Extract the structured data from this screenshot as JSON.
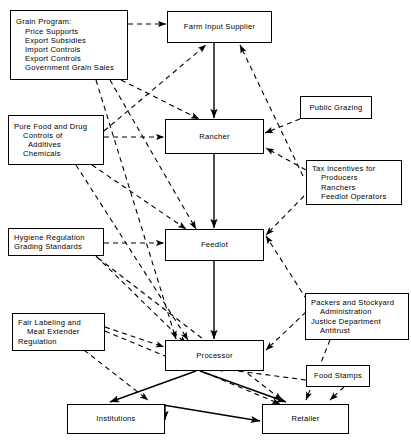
{
  "diagram": {
    "type": "flow-diagram",
    "line_styles": {
      "solid": "commodity flow between market participants",
      "dashed": "government policy / regulatory influence"
    },
    "colors": {
      "background": "#ffffff",
      "stroke": "#000000",
      "text": "#000000"
    }
  },
  "nodes": {
    "grain_program": {
      "id": "grain-program",
      "kind": "policy",
      "lines": [
        "Grain Program:",
        "Price Supports",
        "Export Subsidies",
        "Import Controls",
        "Export Controls",
        "Government Grain Sales"
      ]
    },
    "pure_food_drug": {
      "id": "pure-food-and-drug",
      "kind": "policy",
      "lines": [
        "Pure Food and Drug",
        "Controls of",
        "Additives",
        "Chemicals"
      ]
    },
    "hygiene_regulation": {
      "id": "hygiene-regulation",
      "kind": "policy",
      "lines": [
        "Hygiene Regulation",
        "Grading Standards"
      ]
    },
    "fair_labeling": {
      "id": "fair-labeling",
      "kind": "policy",
      "lines": [
        "Fair Labeling and",
        "Meat Extender",
        "Regulation"
      ]
    },
    "farm_input_supplier": {
      "id": "farm-input-supplier",
      "kind": "actor",
      "lines": [
        "Farm Input Supplier"
      ]
    },
    "rancher": {
      "id": "rancher",
      "kind": "actor",
      "lines": [
        "Rancher"
      ]
    },
    "feedlot": {
      "id": "feedlot",
      "kind": "actor",
      "lines": [
        "Feedlot"
      ]
    },
    "processor": {
      "id": "processor",
      "kind": "actor",
      "lines": [
        "Processor"
      ]
    },
    "institutions": {
      "id": "institutions",
      "kind": "actor",
      "lines": [
        "Institutions"
      ]
    },
    "retailer": {
      "id": "retailer",
      "kind": "actor",
      "lines": [
        "Retailer"
      ]
    },
    "public_grazing": {
      "id": "public-grazing",
      "kind": "policy",
      "lines": [
        "Public Grazing"
      ]
    },
    "tax_incentives": {
      "id": "tax-incentives",
      "kind": "policy",
      "lines": [
        "Tax Incentives for",
        "Producers",
        "Ranchers",
        "Feedlot Operators"
      ]
    },
    "packers_stockyard": {
      "id": "packers-and-stockyard",
      "kind": "policy",
      "lines": [
        "Packers and Stockyard",
        "Administration",
        "Justice Department",
        "Antitrust"
      ]
    },
    "food_stamps": {
      "id": "food-stamps",
      "kind": "policy",
      "lines": [
        "Food Stamps"
      ]
    }
  },
  "edges": [
    {
      "from": "farm_input_supplier",
      "to": "rancher",
      "style": "solid"
    },
    {
      "from": "rancher",
      "to": "feedlot",
      "style": "solid"
    },
    {
      "from": "feedlot",
      "to": "processor",
      "style": "solid"
    },
    {
      "from": "processor",
      "to": "institutions",
      "style": "solid"
    },
    {
      "from": "processor",
      "to": "retailer",
      "style": "solid"
    },
    {
      "from": "institutions",
      "to": "retailer",
      "style": "solid"
    },
    {
      "from": "grain_program",
      "to": "farm_input_supplier",
      "style": "dashed"
    },
    {
      "from": "grain_program",
      "to": "rancher",
      "style": "dashed"
    },
    {
      "from": "grain_program",
      "to": "feedlot",
      "style": "dashed"
    },
    {
      "from": "grain_program",
      "to": "processor",
      "style": "dashed"
    },
    {
      "from": "pure_food_drug",
      "to": "rancher",
      "style": "dashed"
    },
    {
      "from": "pure_food_drug",
      "to": "farm_input_supplier",
      "style": "dashed"
    },
    {
      "from": "pure_food_drug",
      "to": "feedlot",
      "style": "dashed"
    },
    {
      "from": "pure_food_drug",
      "to": "processor",
      "style": "dashed"
    },
    {
      "from": "public_grazing",
      "to": "rancher",
      "style": "dashed"
    },
    {
      "from": "tax_incentives",
      "to": "rancher",
      "style": "dashed"
    },
    {
      "from": "tax_incentives",
      "to": "farm_input_supplier",
      "style": "dashed"
    },
    {
      "from": "tax_incentives",
      "to": "feedlot",
      "style": "dashed"
    },
    {
      "from": "hygiene_regulation",
      "to": "feedlot",
      "style": "dashed"
    },
    {
      "from": "hygiene_regulation",
      "to": "processor",
      "style": "dashed"
    },
    {
      "from": "hygiene_regulation",
      "to": "retailer",
      "style": "dashed"
    },
    {
      "from": "fair_labeling",
      "to": "processor",
      "style": "dashed"
    },
    {
      "from": "fair_labeling",
      "to": "retailer",
      "style": "dashed"
    },
    {
      "from": "fair_labeling",
      "to": "institutions",
      "style": "dashed"
    },
    {
      "from": "packers_stockyard",
      "to": "feedlot",
      "style": "dashed"
    },
    {
      "from": "packers_stockyard",
      "to": "processor",
      "style": "dashed"
    },
    {
      "from": "packers_stockyard",
      "to": "retailer",
      "style": "dashed"
    },
    {
      "from": "food_stamps",
      "to": "retailer",
      "style": "dashed"
    }
  ]
}
